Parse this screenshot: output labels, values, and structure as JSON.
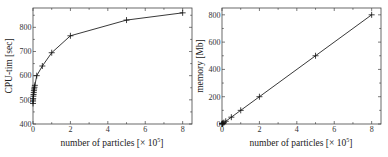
{
  "chart_data": [
    {
      "type": "line",
      "title": "",
      "xlabel": "number of particles [× 10^5]",
      "ylabel": "CPU-tim [sec]",
      "xlim": [
        0,
        8.5
      ],
      "ylim": [
        400,
        880
      ],
      "xticks": [
        0,
        2,
        4,
        6,
        8
      ],
      "yticks": [
        400,
        500,
        600,
        700,
        800
      ],
      "grid": false,
      "legend": null,
      "markers": "plus",
      "series": [
        {
          "name": "CPU time",
          "x": [
            0.001,
            0.005,
            0.01,
            0.02,
            0.03,
            0.04,
            0.05,
            0.06,
            0.08,
            0.1,
            0.2,
            0.5,
            1,
            2,
            5,
            8
          ],
          "y": [
            485,
            495,
            505,
            515,
            522,
            530,
            538,
            545,
            552,
            560,
            600,
            640,
            695,
            765,
            830,
            860
          ]
        }
      ]
    },
    {
      "type": "line",
      "title": "",
      "xlabel": "number of particles [× 10^5]",
      "ylabel": "memory [Mb]",
      "xlim": [
        0,
        8.5
      ],
      "ylim": [
        0,
        850
      ],
      "xticks": [
        0,
        2,
        4,
        6,
        8
      ],
      "yticks": [
        0,
        200,
        400,
        600,
        800
      ],
      "grid": false,
      "legend": null,
      "markers": "plus",
      "series": [
        {
          "name": "memory",
          "x": [
            0.001,
            0.01,
            0.02,
            0.05,
            0.1,
            0.2,
            0.5,
            1,
            2,
            5,
            8
          ],
          "y": [
            1,
            1,
            2,
            5,
            10,
            20,
            50,
            100,
            200,
            500,
            800
          ]
        }
      ]
    }
  ],
  "charts": [
    {
      "ylabel": "CPU-tim [sec]",
      "xlabel_main": "number of particles [× 10",
      "xlabel_sup": "5",
      "xlabel_end": "]",
      "xtick_labels": [
        "0",
        "2",
        "4",
        "6",
        "8"
      ],
      "ytick_labels": [
        "400",
        "500",
        "600",
        "700",
        "800"
      ]
    },
    {
      "ylabel": "memory [Mb]",
      "xlabel_main": "number of particles [× 10",
      "xlabel_sup": "5",
      "xlabel_end": "]",
      "xtick_labels": [
        "0",
        "2",
        "4",
        "6",
        "8"
      ],
      "ytick_labels": [
        "0",
        "200",
        "400",
        "600",
        "800"
      ]
    }
  ]
}
